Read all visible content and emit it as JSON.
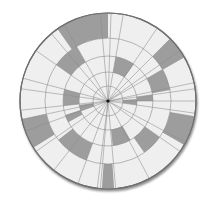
{
  "diagram": {
    "type": "polar-grid",
    "center": [
      108,
      101
    ],
    "rings": [
      0,
      15,
      29,
      45,
      63,
      88
    ],
    "spokes_deg": [
      -95,
      -85,
      -62,
      -35,
      -28,
      -8,
      0,
      8,
      12,
      30,
      35,
      45,
      56,
      80,
      88,
      95,
      120,
      130,
      145,
      165,
      172,
      186,
      192,
      200,
      215,
      232,
      250,
      263
    ],
    "colors": {
      "background": "#ffffff",
      "cell_light": "#efefef",
      "cell_dark": "#9d9d9d",
      "grid_line": "#8c8c8c",
      "outline": "#6f6f6f",
      "center_dot": "#111111"
    },
    "shaded_cells": [
      {
        "ring": 4,
        "start": 90,
        "end": 125
      },
      {
        "ring": 4,
        "start": 30,
        "end": 45
      },
      {
        "ring": 4,
        "start": 192,
        "end": 212
      },
      {
        "ring": 4,
        "start": 330,
        "end": 350
      },
      {
        "ring": 4,
        "start": 266,
        "end": 274
      },
      {
        "ring": 3,
        "start": 120,
        "end": 145
      },
      {
        "ring": 3,
        "start": 10,
        "end": 30
      },
      {
        "ring": 3,
        "start": 218,
        "end": 250
      },
      {
        "ring": 3,
        "start": 305,
        "end": 325
      },
      {
        "ring": 2,
        "start": 55,
        "end": 80
      },
      {
        "ring": 2,
        "start": 165,
        "end": 186
      },
      {
        "ring": 2,
        "start": 276,
        "end": 300
      },
      {
        "ring": 1,
        "start": -8,
        "end": 4
      },
      {
        "ring": 1,
        "start": 188,
        "end": 200
      },
      {
        "ring": 2,
        "start": 0,
        "end": 8
      },
      {
        "ring": 2,
        "start": 198,
        "end": 208
      }
    ]
  }
}
